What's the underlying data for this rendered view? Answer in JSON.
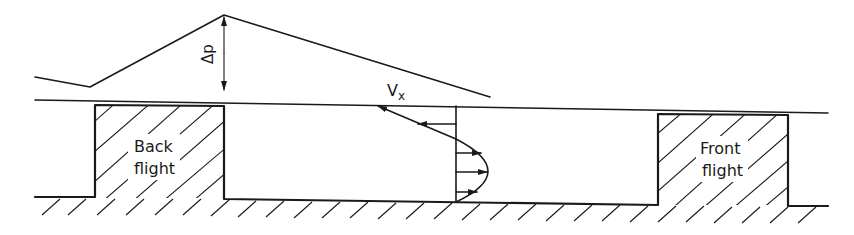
{
  "figure": {
    "type": "screw-channel-flow-diagram",
    "labels": {
      "pressure_difference": "Δp",
      "velocity": "V",
      "velocity_subscript": "x",
      "back_flight_line1": "Back",
      "back_flight_line2": "flight",
      "front_flight_line1": "Front",
      "front_flight_line2": "flight"
    },
    "colors": {
      "ink": "#1a1a1a",
      "background": "#ffffff"
    },
    "pressure_profile": {
      "points": [
        [
          35,
          77
        ],
        [
          90,
          87
        ],
        [
          224,
          15
        ],
        [
          490,
          97
        ]
      ],
      "delta_p_arrow": {
        "x": 224,
        "y_top": 16,
        "y_bottom": 91
      }
    },
    "barrel_line": {
      "x1": 35,
      "y1": 100,
      "x2": 828,
      "y2": 113
    },
    "back_flight": {
      "x_left": 95,
      "x_right": 224,
      "y_top": 105,
      "y_bottom": 198
    },
    "front_flight": {
      "x_left": 658,
      "x_right": 788,
      "y_top": 114,
      "y_bottom": 205
    },
    "channel_root": {
      "x_left": 224,
      "x_right": 658,
      "y_left": 199,
      "y_right": 205
    },
    "velocity_profile": {
      "axis_x": 456,
      "drag_line": [
        [
          377,
          106
        ],
        [
          456,
          139
        ]
      ],
      "backward_arrows_y": [
        106,
        124
      ],
      "forward_arrows_y": [
        153,
        172,
        192
      ],
      "parabola_peak_x": 488
    }
  }
}
